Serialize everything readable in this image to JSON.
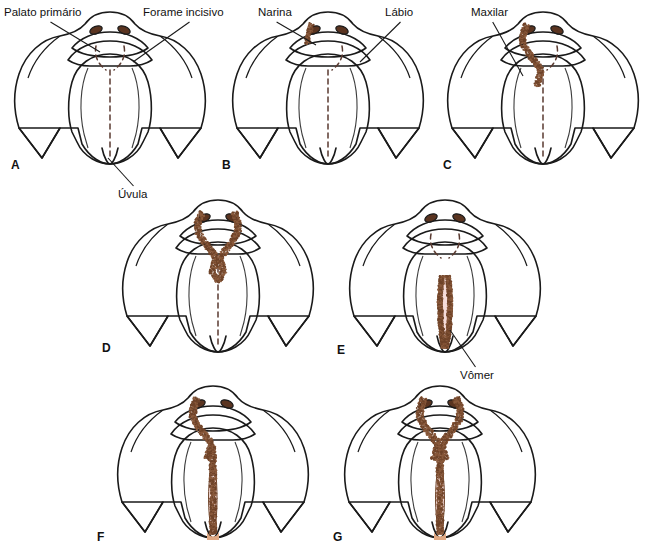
{
  "figure": {
    "background_color": "#ffffff",
    "palette": {
      "bone": "#f3ecdf",
      "bone_shade": "#ece3d2",
      "palate_pink": "#efc8c5",
      "palate_pink_light": "#f5dcd9",
      "cleft_brown": "#8a5a3c",
      "cleft_brown_dark": "#6e4329",
      "nostril": "#5a3420",
      "uvula_tan": "#e0a882",
      "outline": "#1a1a1a",
      "label_text": "#111111"
    },
    "annotations": [
      {
        "id": "palato-primario",
        "text": "Palato primário",
        "x": 4,
        "y": 6,
        "tip_x": 100,
        "tip_y": 52
      },
      {
        "id": "forame-incisivo",
        "text": "Forame incisivo",
        "x": 143,
        "y": 6,
        "tip_x": 133,
        "tip_y": 62
      },
      {
        "id": "uvula",
        "text": "Úvula",
        "x": 118,
        "y": 188,
        "tip_x": 108,
        "tip_y": 158
      },
      {
        "id": "narina",
        "text": "Narina",
        "x": 258,
        "y": 6,
        "tip_x": 316,
        "tip_y": 45
      },
      {
        "id": "labio",
        "text": "Lábio",
        "x": 385,
        "y": 6,
        "tip_x": 360,
        "tip_y": 62
      },
      {
        "id": "maxilar",
        "text": "Maxilar",
        "x": 471,
        "y": 6,
        "tip_x": 523,
        "tip_y": 76
      },
      {
        "id": "vomer",
        "text": "Vômer",
        "x": 460,
        "y": 369,
        "tip_x": 450,
        "tip_y": 330
      }
    ],
    "panels": [
      {
        "letter": "A",
        "label_x": 11,
        "label_y": 158,
        "origin_x": 10,
        "origin_y": 8,
        "cleft": "none",
        "caption": "Palato normal"
      },
      {
        "letter": "B",
        "label_x": 222,
        "label_y": 158,
        "origin_x": 228,
        "origin_y": 8,
        "cleft": "unilateral-lip",
        "caption": "Fenda labial unilateral"
      },
      {
        "letter": "C",
        "label_x": 443,
        "label_y": 158,
        "origin_x": 443,
        "origin_y": 8,
        "cleft": "unilateral-lip-alveolus",
        "caption": "Fenda labial e alveolar unilateral"
      },
      {
        "letter": "D",
        "label_x": 102,
        "label_y": 341,
        "origin_x": 118,
        "origin_y": 196,
        "cleft": "bilateral-lip-alveolus",
        "caption": "Fenda labial e alveolar bilateral"
      },
      {
        "letter": "E",
        "label_x": 337,
        "label_y": 343,
        "origin_x": 345,
        "origin_y": 196,
        "cleft": "secondary-palate",
        "caption": "Fenda do palato secundário"
      },
      {
        "letter": "F",
        "label_x": 97,
        "label_y": 530,
        "origin_x": 113,
        "origin_y": 382,
        "cleft": "unilateral-complete",
        "caption": "Fenda unilateral completa"
      },
      {
        "letter": "G",
        "label_x": 333,
        "label_y": 530,
        "origin_x": 340,
        "origin_y": 382,
        "cleft": "bilateral-complete",
        "caption": "Fenda bilateral completa"
      }
    ]
  }
}
